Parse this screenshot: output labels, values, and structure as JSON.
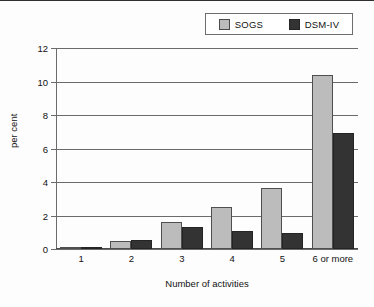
{
  "chart_data": {
    "type": "bar",
    "title": "",
    "xlabel": "Number of activities",
    "ylabel": "per cent",
    "categories": [
      "1",
      "2",
      "3",
      "4",
      "5",
      "6 or more"
    ],
    "series": [
      {
        "name": "SOGS",
        "color": "#bcbcbc",
        "values": [
          0.1,
          0.45,
          1.6,
          2.5,
          3.65,
          10.4
        ]
      },
      {
        "name": "DSM-IV",
        "color": "#333333",
        "values": [
          0.15,
          0.55,
          1.3,
          1.05,
          0.95,
          6.9
        ]
      }
    ],
    "ylim": [
      0,
      12
    ],
    "yticks": [
      0,
      2,
      4,
      6,
      8,
      10,
      12
    ],
    "ytick_labels": [
      "0",
      "2",
      "4",
      "6",
      "8",
      "10",
      "12"
    ],
    "grid": true,
    "legend_position": "top-right"
  },
  "legend": {
    "entries": [
      {
        "label": "SOGS"
      },
      {
        "label": "DSM-IV"
      }
    ]
  },
  "axes": {
    "x_title": "Number of activities",
    "y_title": "per cent"
  }
}
